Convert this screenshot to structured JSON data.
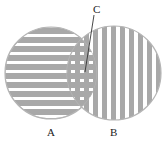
{
  "diagram": {
    "type": "venn-two-set",
    "labels": {
      "a": "A",
      "b": "B",
      "c": "C"
    },
    "regions": [
      {
        "id": "A",
        "description": "left circle",
        "pattern": "horizontal-stripes"
      },
      {
        "id": "B",
        "description": "right circle",
        "pattern": "vertical-stripes"
      },
      {
        "id": "C",
        "description": "intersection of A and B",
        "pattern": "crosshatch-grid"
      }
    ],
    "colors": {
      "stripe": "#a8a8a8",
      "outline": "#b5b5b5",
      "background": "#ffffff",
      "leader_line": "#333333",
      "text": "#222222"
    }
  }
}
